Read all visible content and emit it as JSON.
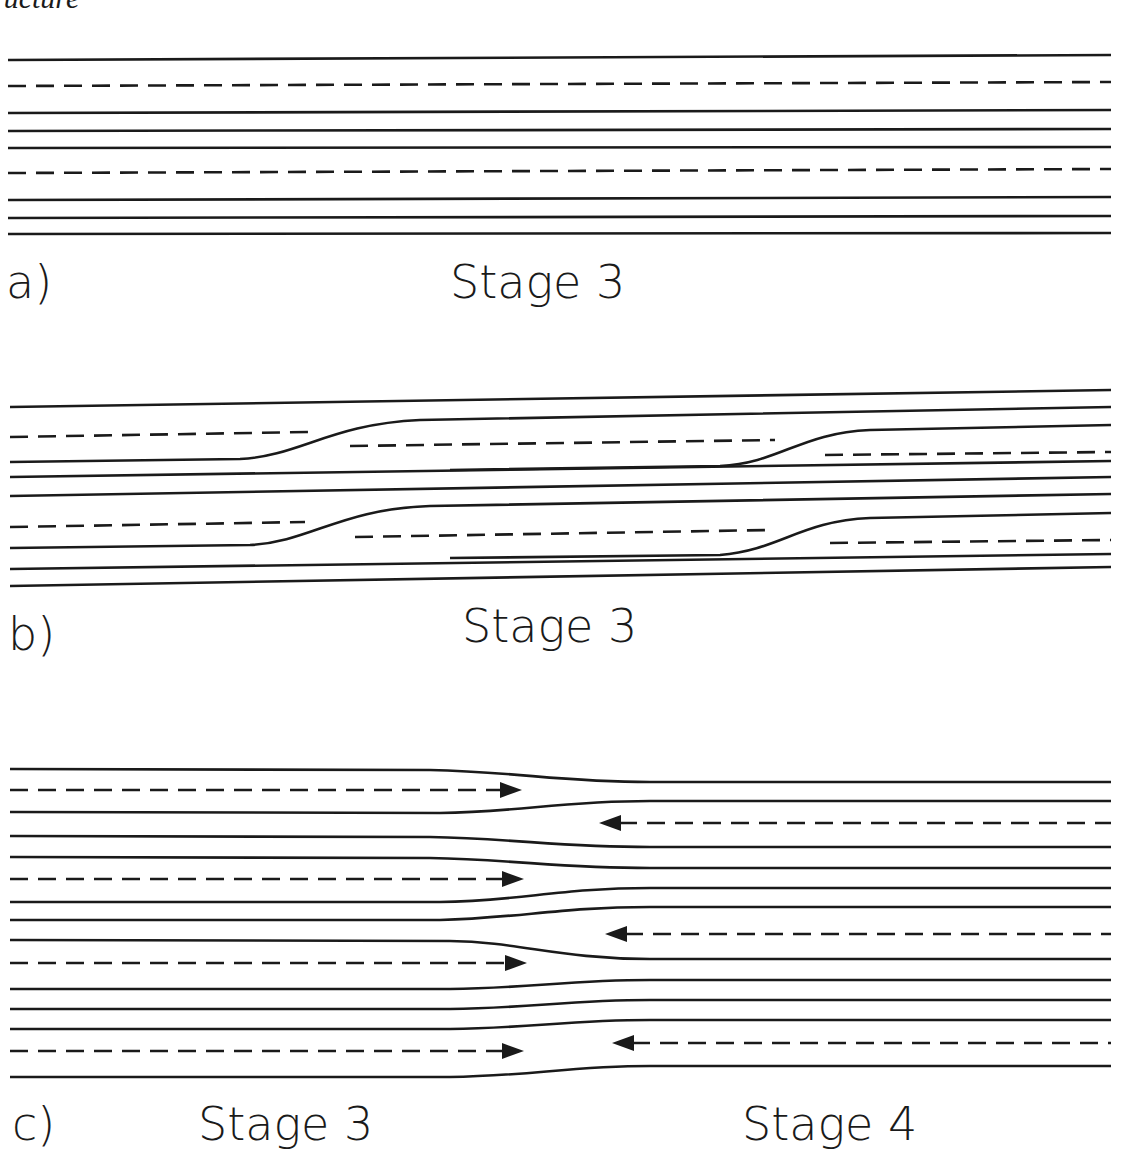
{
  "header": {
    "partial_text": "ructure"
  },
  "colors": {
    "ink": "#1a1a1a",
    "background": "#ffffff"
  },
  "panels": [
    {
      "id": "a",
      "label": "a)",
      "stage_labels": [
        "Stage 3"
      ],
      "label_pos": {
        "letter": [
          6,
          298
        ],
        "stages": [
          [
            450,
            298
          ]
        ]
      },
      "x_start": 8,
      "x_end": 1111,
      "lines": [
        {
          "type": "solid",
          "y_left": 60,
          "y_right": 55
        },
        {
          "type": "dashed",
          "y_left": 86,
          "y_right": 82
        },
        {
          "type": "solid",
          "y_left": 113,
          "y_right": 110
        },
        {
          "type": "solid",
          "y_left": 131,
          "y_right": 129
        },
        {
          "type": "solid",
          "y_left": 148,
          "y_right": 147
        },
        {
          "type": "dashed",
          "y_left": 173,
          "y_right": 169
        },
        {
          "type": "solid",
          "y_left": 200,
          "y_right": 197
        },
        {
          "type": "solid",
          "y_left": 218,
          "y_right": 216
        },
        {
          "type": "solid",
          "y_left": 234,
          "y_right": 233
        }
      ]
    },
    {
      "id": "b",
      "label": "b)",
      "stage_labels": [
        "Stage 3"
      ],
      "label_pos": {
        "letter": [
          8,
          650
        ],
        "stages": [
          [
            462,
            642
          ]
        ]
      },
      "solid_paths": [
        "M10,407 L1111,390",
        "M10,462 L240,459 C300,456 330,424 420,420 L1111,407",
        "M10,477 L1111,461",
        "M10,496 L1111,477",
        "M10,548 L250,545 C310,542 340,509 430,506 L1111,494",
        "M10,569 L1111,554",
        "M10,586 L1111,567",
        "M450,470 L720,466 C780,463 800,433 870,430 L1111,425",
        "M450,558 L720,555 C780,550 800,521 870,518 L1111,513"
      ],
      "dashed_paths": [
        "M10,437 L308,432",
        "M350,446 L775,440",
        "M825,455 L1111,452",
        "M10,527 L305,522",
        "M355,537 L770,530",
        "M830,543 L1111,540"
      ]
    },
    {
      "id": "c",
      "label": "c)",
      "stage_labels": [
        "Stage 3",
        "Stage 4"
      ],
      "label_pos": {
        "letter": [
          12,
          1140
        ],
        "stages": [
          [
            198,
            1140
          ],
          [
            742,
            1140
          ]
        ]
      },
      "solid_paths": [
        "M10,769 L430,770 C520,772 560,782 650,782 L1111,782",
        "M10,812 L440,813 C520,812 560,801 650,801 L1111,801",
        "M10,836 L430,837 C520,839 560,847 650,847 L1111,847",
        "M10,857 L430,858 C520,860 560,868 650,868 L1111,868",
        "M10,902 L440,902 C520,901 560,888 650,888 L1111,888",
        "M10,920 L440,920 C520,918 560,907 650,907 L1111,907",
        "M10,940 L450,941 C520,942 560,959 650,959 L1111,959",
        "M10,989 L450,989 C530,988 570,980 650,980 L1111,980",
        "M10,1009 L450,1009 C530,1008 570,1000 650,1000 L1111,1000",
        "M10,1029 L450,1029 C530,1028 570,1020 650,1020 L1111,1020",
        "M10,1077 L450,1077 C530,1076 570,1066 650,1066 L1111,1066"
      ],
      "arrows_right": [
        {
          "y": 790,
          "x_start": 10,
          "x_tip": 522
        },
        {
          "y": 879,
          "x_start": 10,
          "x_tip": 524
        },
        {
          "y": 963,
          "x_start": 10,
          "x_tip": 527
        },
        {
          "y": 1051,
          "x_start": 10,
          "x_tip": 524
        }
      ],
      "arrows_left": [
        {
          "y": 823,
          "x_start": 1111,
          "x_tip": 599
        },
        {
          "y": 934,
          "x_start": 1111,
          "x_tip": 605
        },
        {
          "y": 1043,
          "x_start": 1111,
          "x_tip": 612
        }
      ]
    }
  ]
}
